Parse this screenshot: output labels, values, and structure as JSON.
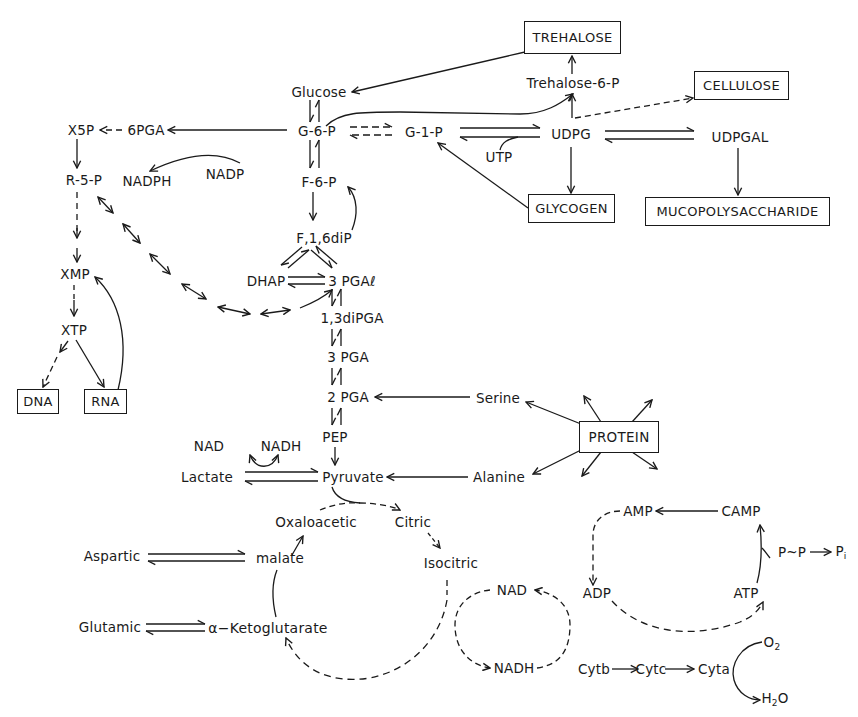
{
  "diagram": {
    "type": "metabolic-pathway-map",
    "boxes": {
      "trehalose": "TREHALOSE",
      "cellulose": "CELLULOSE",
      "glycogen": "GLYCOGEN",
      "mucopolysaccharide": "MUCOPOLYSACCHARIDE",
      "protein": "PROTEIN",
      "dna": "DNA",
      "rna": "RNA"
    },
    "metabolites": {
      "glucose": "Glucose",
      "trehalose_6_p": "Trehalose-6-P",
      "g6p": "G-6-P",
      "g1p": "G-1-P",
      "udpg": "UDPG",
      "udpgal": "UDPGAL",
      "utp": "UTP",
      "x5p": "X5P",
      "pga6": "6PGA",
      "r5p": "R-5-P",
      "nadph_top": "NADPH",
      "nadp": "NADP",
      "f6p": "F-6-P",
      "f16dip": "F,1,6diP",
      "dhap": "DHAP",
      "pgal3": "3 PGAℓ",
      "dipga13": "1,3diPGA",
      "pga3": "3 PGA",
      "pga2": "2 PGA",
      "pep": "PEP",
      "pyruvate": "Pyruvate",
      "lactate": "Lactate",
      "nad_top": "NAD",
      "nadh_top": "NADH",
      "serine": "Serine",
      "alanine": "Alanine",
      "xmp": "XMP",
      "xtp": "XTP",
      "oxaloacetic": "Oxaloacetic",
      "citric": "Citric",
      "isocitric": "Isocitric",
      "malate": "malate",
      "aspartic": "Aspartic",
      "glutamic": "Glutamic",
      "ketoglutarate": "α−Ketoglutarate",
      "nad_cycle": "NAD",
      "nadh_cycle": "NADH",
      "amp": "AMP",
      "camp": "CAMP",
      "adp": "ADP",
      "atp": "ATP",
      "ppi": "P~P",
      "pi": "P",
      "pi_sub": "i",
      "cytb": "Cytb",
      "cytc": "Cytc",
      "cyta": "Cyta",
      "o2": "O",
      "o2_sub": "2",
      "h2o_h": "H",
      "h2o_sub": "2",
      "h2o_o": "O"
    },
    "colors": {
      "ink": "#1a1a1a",
      "background": "#ffffff"
    }
  }
}
